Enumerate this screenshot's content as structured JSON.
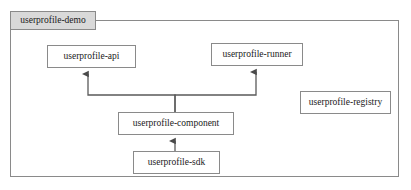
{
  "diagram": {
    "type": "uml-package-component-diagram",
    "package": {
      "tab_label": "userprofile-demo"
    },
    "nodes": [
      {
        "id": "api",
        "label": "userprofile-api"
      },
      {
        "id": "runner",
        "label": "userprofile-runner"
      },
      {
        "id": "registry",
        "label": "userprofile-registry"
      },
      {
        "id": "component",
        "label": "userprofile-component"
      },
      {
        "id": "sdk",
        "label": "userprofile-sdk"
      }
    ],
    "edges": [
      {
        "from": "component",
        "to": "api",
        "style": "arrow"
      },
      {
        "from": "component",
        "to": "runner",
        "style": "arrow"
      },
      {
        "from": "sdk",
        "to": "component",
        "style": "arrow"
      }
    ],
    "colors": {
      "frame_border": "#8a8a8a",
      "tab_fill": "#d9d9d9",
      "node_fill": "#ffffff",
      "node_border": "#8a8a8a",
      "line": "#5a5a5a",
      "text": "#1a1a1a",
      "background": "#ffffff"
    }
  }
}
